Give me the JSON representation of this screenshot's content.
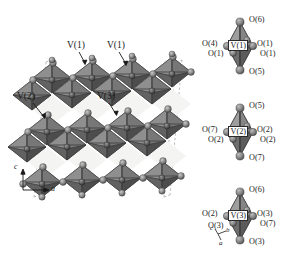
{
  "figure": {
    "type": "crystal-structure-diagram",
    "background_color": "#ffffff"
  },
  "main_panel": {
    "name": "octahedral-framework",
    "unit_cell_outline": "dashed",
    "site_labels": [
      {
        "id": "v1a",
        "text": "V(1)",
        "x": 70,
        "y": 45,
        "arrow_to_x": 83,
        "arrow_to_y": 64
      },
      {
        "id": "v1b",
        "text": "V(1)",
        "x": 110,
        "y": 45,
        "arrow_to_x": 123,
        "arrow_to_y": 65
      },
      {
        "id": "v2",
        "text": "V(2)",
        "x": 23,
        "y": 96,
        "arrow_to_x": 42,
        "arrow_to_y": 115
      },
      {
        "id": "v3",
        "text": "V(3)",
        "x": 100,
        "y": 96,
        "arrow_to_x": 110,
        "arrow_to_y": 114
      }
    ],
    "axes": {
      "origin_x": 23,
      "origin_y": 190,
      "vertical_label": "c",
      "horizontal_label": "a"
    }
  },
  "polyhedra": [
    {
      "id": "poly-v1",
      "center_label": "V(1)",
      "apex_top_label": "O(6)",
      "apex_bottom_label": "O(5)",
      "left_upper_label": "O(4)",
      "left_lower_label": "O(1)",
      "right_upper_label": "O(1)",
      "right_lower_label": "O(1)"
    },
    {
      "id": "poly-v2",
      "center_label": "V(2)",
      "apex_top_label": "O(5)",
      "apex_bottom_label": "O(7)",
      "left_upper_label": "O(7)",
      "left_lower_label": "O(2)",
      "right_upper_label": "O(2)",
      "right_lower_label": "O(2)"
    },
    {
      "id": "poly-v3",
      "center_label": "V(3)",
      "apex_top_label": "O(6)",
      "apex_bottom_label": "O(3)",
      "left_upper_label": "O(2)",
      "left_lower_label": "O(3)",
      "right_upper_label": "O(3)",
      "right_lower_label": "O(7)"
    }
  ],
  "polyhedra_axes": {
    "a_label": "a",
    "b_label": "b",
    "c_label": "c"
  },
  "colors": {
    "octahedron_face_light": "#9a9a9a",
    "octahedron_face_mid": "#7a7a7a",
    "octahedron_face_dark": "#5c5c5c",
    "octahedron_edge": "#3a3a3a",
    "sphere_oxygen": "#8d8d8d",
    "sphere_vanadium": "#5a5a5a",
    "void_fill": "#f2f2f0",
    "dashed_cell": "#a8a8a8",
    "text": "#1a1a1a"
  }
}
